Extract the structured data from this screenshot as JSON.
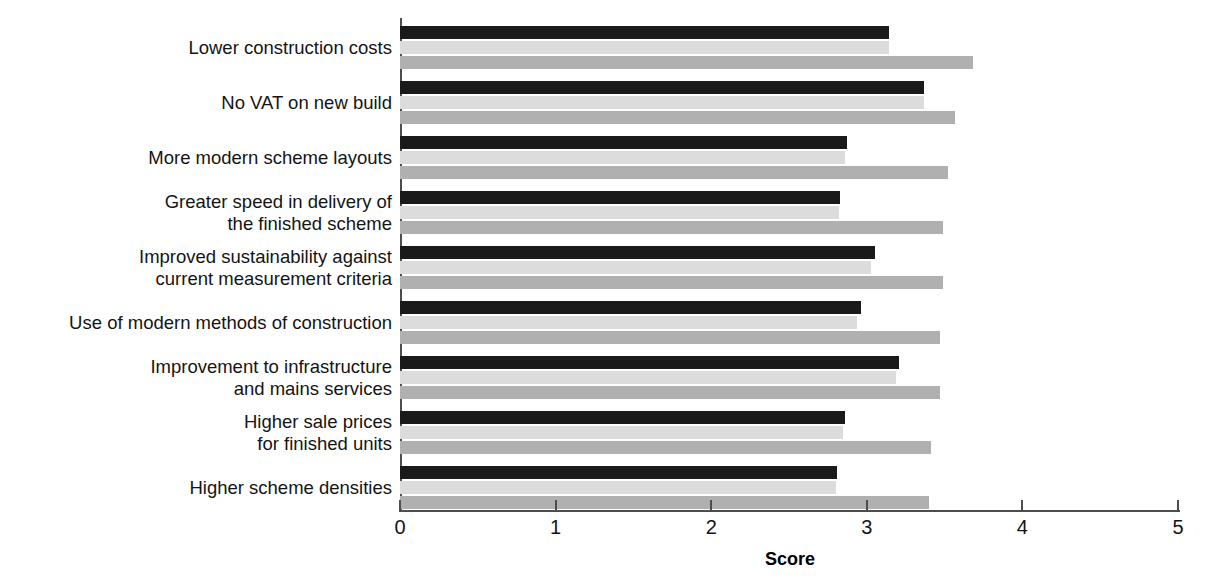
{
  "chart_data": {
    "type": "bar",
    "orientation": "horizontal",
    "title": "",
    "xlabel": "Score",
    "ylabel": "",
    "xlim": [
      0,
      5
    ],
    "xticks": [
      "0",
      "1",
      "2",
      "3",
      "4",
      "5"
    ],
    "grid": false,
    "legend": "none",
    "categories": [
      "Lower construction costs",
      "No VAT on new build",
      "More modern scheme layouts",
      "Greater speed in delivery of\nthe finished scheme",
      "Improved sustainability against\ncurrent measurement criteria",
      "Use of modern methods of construction",
      "Improvement to infrastructure\nand mains services",
      "Higher sale prices\nfor finished units",
      "Higher scheme densities"
    ],
    "series": [
      {
        "name": "series-1",
        "color": "#1a1a1a",
        "values": [
          3.14,
          3.37,
          2.87,
          2.83,
          3.05,
          2.96,
          3.21,
          2.86,
          2.81
        ]
      },
      {
        "name": "series-2",
        "color": "#dcdcdc",
        "values": [
          3.14,
          3.37,
          2.86,
          2.82,
          3.03,
          2.94,
          3.19,
          2.85,
          2.8
        ]
      },
      {
        "name": "series-3",
        "color": "#b0b0b0",
        "values": [
          3.68,
          3.57,
          3.52,
          3.49,
          3.49,
          3.47,
          3.47,
          3.41,
          3.4
        ]
      }
    ]
  }
}
